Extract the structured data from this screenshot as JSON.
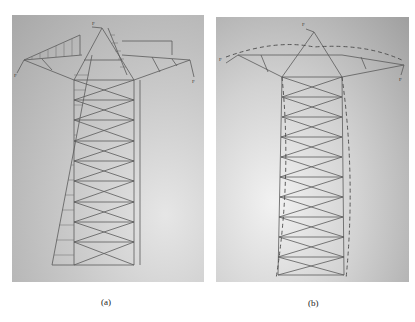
{
  "figure": {
    "panels": [
      {
        "id": "a",
        "caption": "(a)",
        "description": "Lattice transmission tower sketch with wind load distribution (hatched) on left side and cross-arm loads"
      },
      {
        "id": "b",
        "caption": "(b)",
        "description": "Lattice transmission tower sketch with deformed shape shown as dashed line"
      }
    ],
    "title": "",
    "colors": {
      "paper_light": "#e6e6e6",
      "paper_dark": "#a8a8a8",
      "line": "#555555"
    }
  },
  "labels": {
    "a_load_top": "F",
    "a_load_left": "F",
    "a_load_right": "F",
    "b_load_top": "F",
    "b_load_left": "F",
    "b_load_right": "F"
  }
}
